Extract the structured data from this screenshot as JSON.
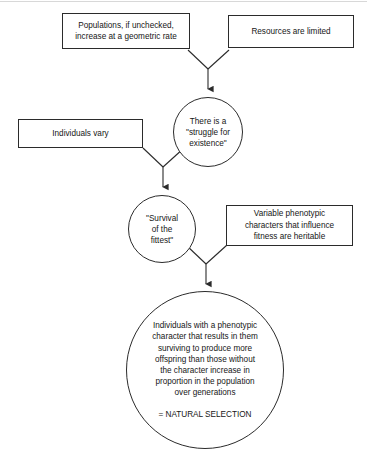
{
  "diagram": {
    "stroke_color": "#2b2b2b",
    "background_color": "#ffffff",
    "nodes": [
      {
        "id": "populations",
        "shape": "rect",
        "text": "Populations, if unchecked,\nincrease at a geometric rate"
      },
      {
        "id": "resources",
        "shape": "rect",
        "text": "Resources are limited"
      },
      {
        "id": "struggle",
        "shape": "circle",
        "text": "There is a\n\"struggle for\nexistence\""
      },
      {
        "id": "individuals_vary",
        "shape": "rect",
        "text": "Individuals vary"
      },
      {
        "id": "survival",
        "shape": "circle",
        "text": "\"Survival\nof the\nfittest\""
      },
      {
        "id": "variable_phenotypic",
        "shape": "rect",
        "text": "Variable phenotypic\ncharacters that influence\nfitness are heritable"
      },
      {
        "id": "natural_selection",
        "shape": "circle",
        "text": "Individuals with a phenotypic\ncharacter that results in them\nsurviving to produce more\noffspring than those without\nthe character increase in\nproportion in the population\nover generations",
        "conclusion": "= NATURAL SELECTION"
      }
    ],
    "connectors": [
      {
        "id": "merge-to-struggle",
        "from": [
          "populations",
          "resources"
        ],
        "to": "struggle"
      },
      {
        "id": "merge-to-survival",
        "from": [
          "individuals_vary",
          "struggle"
        ],
        "to": "survival"
      },
      {
        "id": "merge-to-natural-selection",
        "from": [
          "survival",
          "variable_phenotypic"
        ],
        "to": "natural_selection"
      }
    ]
  }
}
